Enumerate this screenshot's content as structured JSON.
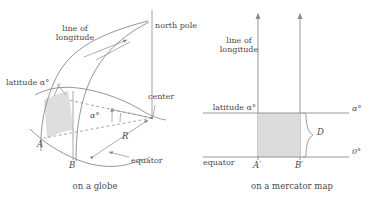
{
  "figure": {
    "title": "",
    "panels": [
      {
        "id": "globe",
        "caption": "on a globe",
        "labels": {
          "line_of_longitude_1": "line of",
          "line_of_longitude_2": "longitude",
          "north_pole": "north pole",
          "latitude_alpha": "latitude α°",
          "center": "center",
          "angle_alpha": "α°",
          "radius": "R",
          "point_a": "A",
          "point_b": "B",
          "equator": "equator"
        }
      },
      {
        "id": "mercator",
        "caption": "on a mercator map",
        "labels": {
          "line_of_longitude_1": "line of",
          "line_of_longitude_2": "longitude",
          "latitude_alpha": "latitude α°",
          "alpha_degrees": "α°",
          "zero_degrees": "0°",
          "distance": "D",
          "point_a_prime": "A′",
          "point_b_prime": "B′",
          "equator": "equator"
        }
      }
    ],
    "colors": {
      "line": "#8a8a8a",
      "dark_line": "#6e6e6e",
      "shade_fill": "#d9d9d9",
      "text": "#4a4a4a",
      "background": "#ffffff"
    }
  }
}
